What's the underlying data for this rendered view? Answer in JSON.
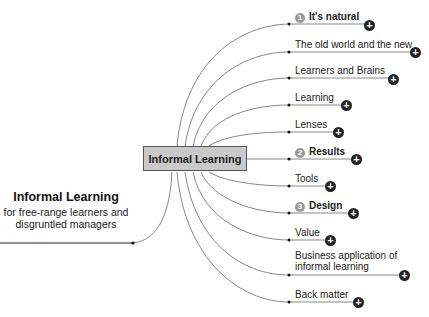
{
  "root": {
    "title": "Informal Learning",
    "subtitle_line1": "for free-range learners and",
    "subtitle_line2": "disgruntled managers"
  },
  "center": {
    "label": "Informal Learning"
  },
  "branches": [
    {
      "label": "It's natural",
      "number": "1",
      "bold": true
    },
    {
      "label": "The old world and the new",
      "bold": false
    },
    {
      "label": "Learners and Brains",
      "bold": false
    },
    {
      "label": "Learning",
      "bold": false
    },
    {
      "label": "Lenses",
      "bold": false
    },
    {
      "label": "Results",
      "number": "2",
      "bold": true
    },
    {
      "label": "Tools",
      "bold": false
    },
    {
      "label": "Design",
      "number": "3",
      "bold": true
    },
    {
      "label": "Value",
      "bold": false
    },
    {
      "label": "Business application of",
      "label_line2": "informal learning",
      "bold": false
    },
    {
      "label": "Back matter",
      "bold": false
    }
  ],
  "icons": {
    "expand": "plus-circle-icon",
    "plus_glyph": "+"
  },
  "colors": {
    "box_fill": "#c9c9c9",
    "line": "#888888",
    "badge": "#999999",
    "plus": "#222222"
  }
}
